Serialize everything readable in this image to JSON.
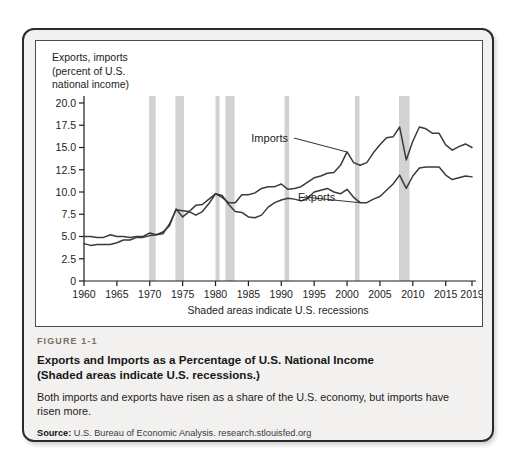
{
  "figure": {
    "number": "FIGURE 1-1",
    "title_line1": "Exports and Imports as a Percentage of U.S. National Income",
    "title_line2": "(Shaded areas indicate U.S. recessions.)",
    "description": "Both imports and exports have risen as a share of the U.S. economy, but imports have risen more.",
    "source_label": "Source:",
    "source_text": "U.S. Bureau of Economic Analysis. research.stlouisfed.org"
  },
  "colors": {
    "card_background": "#f2f1ef",
    "card_border": "#2b2b2b",
    "chart_background": "#ffffff",
    "line": "#3a3a3a",
    "recession_band": "#d2d2d2",
    "axis": "#1c1c1c",
    "figure_number": "#7a6e62"
  },
  "chart_data": {
    "type": "line",
    "title": "",
    "ylabel": "Exports, imports\n(percent of U.S.\nnational income)",
    "xlabel": "Shaded areas indicate U.S. recessions",
    "xlim": [
      1960,
      2019
    ],
    "ylim": [
      0,
      20
    ],
    "grid": false,
    "legend_position": "inline-annotation",
    "yticks": [
      0,
      2.5,
      5.0,
      7.5,
      10.0,
      12.5,
      15.0,
      17.5,
      20.0
    ],
    "ytick_labels": [
      "0",
      "2.5",
      "5.0",
      "7.5",
      "10.0",
      "12.5",
      "15.0",
      "17.5",
      "20.0"
    ],
    "xticks": [
      1960,
      1965,
      1970,
      1975,
      1980,
      1985,
      1990,
      1995,
      2000,
      2005,
      2010,
      2015,
      2019
    ],
    "xtick_labels": [
      "1960",
      "1965",
      "1970",
      "1975",
      "1980",
      "1985",
      "1990",
      "1995",
      "2000",
      "2005",
      "2010",
      "2015",
      "2019"
    ],
    "x": [
      1960,
      1961,
      1962,
      1963,
      1964,
      1965,
      1966,
      1967,
      1968,
      1969,
      1970,
      1971,
      1972,
      1973,
      1974,
      1975,
      1976,
      1977,
      1978,
      1979,
      1980,
      1981,
      1982,
      1983,
      1984,
      1985,
      1986,
      1987,
      1988,
      1989,
      1990,
      1991,
      1992,
      1993,
      1994,
      1995,
      1996,
      1997,
      1998,
      1999,
      2000,
      2001,
      2002,
      2003,
      2004,
      2005,
      2006,
      2007,
      2008,
      2009,
      2010,
      2011,
      2012,
      2013,
      2014,
      2015,
      2016,
      2017,
      2018,
      2019
    ],
    "series": [
      {
        "name": "Exports",
        "label_annotation": "Exports",
        "values": [
          5.0,
          5.0,
          4.9,
          4.9,
          5.2,
          5.0,
          5.0,
          4.9,
          5.0,
          5.0,
          5.4,
          5.2,
          5.3,
          6.4,
          8.0,
          7.9,
          7.8,
          7.4,
          7.8,
          8.7,
          9.8,
          9.6,
          8.6,
          7.8,
          7.7,
          7.2,
          7.1,
          7.4,
          8.3,
          8.8,
          9.1,
          9.3,
          9.2,
          9.0,
          9.3,
          10.0,
          10.2,
          10.4,
          10.0,
          9.8,
          10.3,
          9.4,
          8.8,
          8.8,
          9.2,
          9.5,
          10.2,
          10.9,
          11.9,
          10.4,
          11.8,
          12.7,
          12.8,
          12.8,
          12.8,
          11.9,
          11.4,
          11.6,
          11.8,
          11.7
        ]
      },
      {
        "name": "Imports",
        "label_annotation": "Imports",
        "values": [
          4.2,
          4.0,
          4.1,
          4.1,
          4.1,
          4.3,
          4.6,
          4.6,
          4.9,
          4.9,
          5.1,
          5.2,
          5.5,
          6.2,
          8.1,
          7.2,
          7.8,
          8.5,
          8.6,
          9.2,
          9.8,
          9.4,
          8.8,
          8.8,
          9.7,
          9.7,
          9.9,
          10.4,
          10.6,
          10.6,
          10.9,
          10.3,
          10.4,
          10.6,
          11.1,
          11.6,
          11.8,
          12.1,
          12.2,
          13.0,
          14.5,
          13.3,
          13.0,
          13.3,
          14.4,
          15.3,
          16.1,
          16.2,
          17.3,
          13.6,
          15.7,
          17.3,
          17.1,
          16.6,
          16.6,
          15.3,
          14.7,
          15.1,
          15.4,
          15.0
        ]
      }
    ],
    "recessions": [
      {
        "start": 1969.9,
        "end": 1970.9
      },
      {
        "start": 1973.9,
        "end": 1975.2
      },
      {
        "start": 1980.0,
        "end": 1980.6
      },
      {
        "start": 1981.5,
        "end": 1982.9
      },
      {
        "start": 1990.5,
        "end": 1991.2
      },
      {
        "start": 2001.2,
        "end": 2001.9
      },
      {
        "start": 2007.9,
        "end": 2009.5
      }
    ]
  }
}
